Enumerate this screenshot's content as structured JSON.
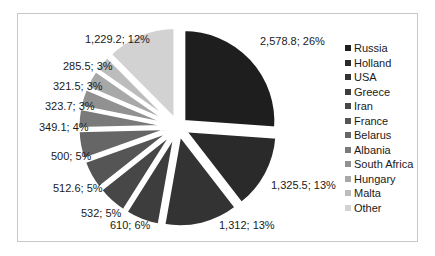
{
  "chart_data": {
    "type": "pie",
    "title": "",
    "exploded": true,
    "start_angle": "12 o'clock, clockwise",
    "legend_position": "right",
    "categories": [
      "Russia",
      "Holland",
      "USA",
      "Greece",
      "Iran",
      "France",
      "Belarus",
      "Albania",
      "South Africa",
      "Hungary",
      "Malta",
      "Other"
    ],
    "values": [
      2578.8,
      1325.5,
      1312,
      610,
      532,
      512.6,
      500,
      349.1,
      323.7,
      321.5,
      285.5,
      1229.2
    ],
    "percentages": [
      26,
      13,
      13,
      6,
      5,
      5,
      5,
      4,
      3,
      3,
      3,
      12
    ],
    "data_labels": [
      "2,578.8; 26%",
      "1,325.5; 13%",
      "1,312; 13%",
      "610; 6%",
      "532; 5%",
      "512.6; 5%",
      "500; 5%",
      "349.1;  4%",
      "323.7; 3%",
      "321.5; 3%",
      "285.5; 3%",
      "1,229.2; 12%"
    ],
    "colors": [
      "#1e1e1e",
      "#2a2a2a",
      "#333333",
      "#3d3d3d",
      "#474747",
      "#555555",
      "#666666",
      "#7a7a7a",
      "#919191",
      "#a8a8a8",
      "#bcbcbc",
      "#d2d2d2"
    ]
  },
  "legend": {
    "items": [
      {
        "label": "Russia",
        "color": "#1e1e1e"
      },
      {
        "label": "Holland",
        "color": "#2a2a2a"
      },
      {
        "label": "USA",
        "color": "#333333"
      },
      {
        "label": "Greece",
        "color": "#3d3d3d"
      },
      {
        "label": "Iran",
        "color": "#474747"
      },
      {
        "label": "France",
        "color": "#555555"
      },
      {
        "label": "Belarus",
        "color": "#666666"
      },
      {
        "label": "Albania",
        "color": "#7a7a7a"
      },
      {
        "label": "South Africa",
        "color": "#919191"
      },
      {
        "label": "Hungary",
        "color": "#a8a8a8"
      },
      {
        "label": "Malta",
        "color": "#bcbcbc"
      },
      {
        "label": "Other",
        "color": "#d2d2d2"
      }
    ]
  },
  "labels": [
    {
      "text": "2,578.8; 26%",
      "x": 260,
      "y": 35
    },
    {
      "text": "1,325.5; 13%",
      "x": 271,
      "y": 179
    },
    {
      "text": "1,312; 13%",
      "x": 219,
      "y": 219
    },
    {
      "text": "610; 6%",
      "x": 110,
      "y": 219
    },
    {
      "text": "532; 5%",
      "x": 81,
      "y": 207
    },
    {
      "text": "512.6; 5%",
      "x": 53,
      "y": 182
    },
    {
      "text": "500; 5%",
      "x": 51,
      "y": 150
    },
    {
      "text": "349.1;  4%",
      "x": 39,
      "y": 121
    },
    {
      "text": "323.7; 3%",
      "x": 45,
      "y": 100
    },
    {
      "text": "321.5; 3%",
      "x": 53,
      "y": 80
    },
    {
      "text": "285.5; 3%",
      "x": 63,
      "y": 60
    },
    {
      "text": "1,229.2; 12%",
      "x": 85,
      "y": 33
    }
  ]
}
